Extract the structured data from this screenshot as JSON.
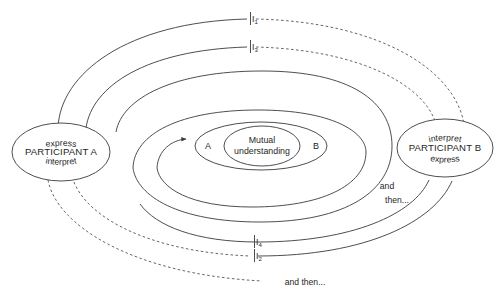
{
  "diagram": {
    "type": "process-diagram",
    "colors": {
      "stroke": "#3a3a3a",
      "dashed_stroke": "#555555",
      "text": "#262626",
      "background": "#ffffff"
    },
    "participants": [
      {
        "id": "participant-a",
        "name": "PARTICIPANT A",
        "top_role": "express",
        "bottom_role": "interpret",
        "side": "left"
      },
      {
        "id": "participant-b",
        "name": "PARTICIPANT B",
        "top_role": "interpret",
        "bottom_role": "express",
        "side": "right"
      }
    ],
    "center": {
      "left_label": "A",
      "right_label": "B",
      "inner_line1": "Mutual",
      "inner_line2": "understanding"
    },
    "markers": [
      {
        "id": "marker-i1",
        "base": "I",
        "subscript": "1",
        "line_style": "solid-left-dashed-right",
        "position": "top-outer"
      },
      {
        "id": "marker-i3",
        "base": "I",
        "subscript": "3",
        "line_style": "solid-left-dashed-right",
        "position": "top-inner"
      },
      {
        "id": "marker-i4",
        "base": "I",
        "subscript": "4",
        "line_style": "solid",
        "position": "bottom-inner"
      },
      {
        "id": "marker-i2",
        "base": "I",
        "subscript": "2",
        "line_style": "dashed-left-solid-right",
        "position": "bottom-outer"
      }
    ],
    "annotations": [
      {
        "id": "annotation-and",
        "text": "and",
        "position": "right-middle"
      },
      {
        "id": "annotation-then",
        "text": "then...",
        "position": "right-middle-lower"
      },
      {
        "id": "annotation-and-then-bottom",
        "text": "and then...",
        "position": "bottom-center"
      }
    ]
  }
}
